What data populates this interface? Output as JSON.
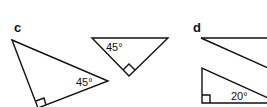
{
  "panels": [
    {
      "label": "c",
      "triangles": [
        {
          "angle_label": "45°",
          "right_angle": true
        },
        {
          "angle_label": "45°",
          "right_angle": true
        }
      ]
    },
    {
      "label": "d",
      "triangles": [
        {
          "angle_label": "",
          "right_angle": false
        },
        {
          "angle_label": "20°",
          "right_angle": true
        }
      ]
    }
  ],
  "colors": {
    "stroke": "#111111",
    "background": "#ffffff"
  }
}
